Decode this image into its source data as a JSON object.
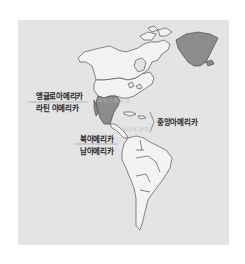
{
  "map": {
    "title": "",
    "colors": {
      "background": "#e4e4e4",
      "land": "#f2f2f2",
      "highlight": "#8c8c8c",
      "border": "#3a3a3a"
    },
    "labels": {
      "anglo_america": "앵글로아메리카",
      "latin_america": "라틴 아메리카",
      "rio_grande": "리오그란데 강",
      "panama_canal": "파나마 운하",
      "central_america": "중앙아메리카",
      "north_america": "북아메리카",
      "south_america": "남아메리카"
    },
    "shaded_regions": [
      "Greenland",
      "Mexico"
    ]
  }
}
